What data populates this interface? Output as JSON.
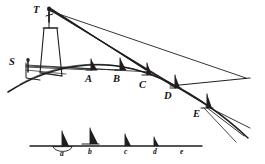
{
  "figure": {
    "caption": "",
    "ink_color": "#201d1c",
    "background_color": "#ffffff",
    "style": "antique line engraving"
  },
  "upper_scene": {
    "description": "Curved earth horizon with tower and ships",
    "labels": [
      {
        "id": "T",
        "text": "T",
        "role": "observer-top-of-tower",
        "x": 33,
        "y": 5
      },
      {
        "id": "S",
        "text": "S",
        "role": "observer-at-sea-level",
        "x": 9,
        "y": 57
      },
      {
        "id": "A",
        "text": "A",
        "role": "ship-position",
        "x": 85,
        "y": 74
      },
      {
        "id": "B",
        "text": "B",
        "role": "ship-position",
        "x": 113,
        "y": 74
      },
      {
        "id": "C",
        "text": "C",
        "role": "ship-position",
        "x": 139,
        "y": 80
      },
      {
        "id": "D",
        "text": "D",
        "role": "ship-position",
        "x": 164,
        "y": 91
      },
      {
        "id": "E",
        "text": "E",
        "role": "ship-position",
        "x": 193,
        "y": 109
      }
    ]
  },
  "lower_scene": {
    "description": "Straight reference line with ships receding",
    "labels": [
      {
        "id": "a",
        "text": "a",
        "role": "ship-position",
        "x": 60,
        "y": 150
      },
      {
        "id": "b",
        "text": "b",
        "role": "ship-position",
        "x": 88,
        "y": 148
      },
      {
        "id": "c",
        "text": "c",
        "role": "ship-position",
        "x": 124,
        "y": 148
      },
      {
        "id": "d",
        "text": "d",
        "role": "ship-position",
        "x": 153,
        "y": 148
      },
      {
        "id": "e",
        "text": "e",
        "role": "ship-position",
        "x": 180,
        "y": 148
      }
    ]
  }
}
